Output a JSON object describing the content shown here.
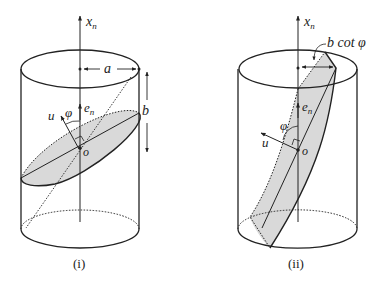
{
  "figure": {
    "panels": [
      {
        "id": "i",
        "caption": "(i)",
        "labels": {
          "axis": "x",
          "axis_sub": "n",
          "radius": "a",
          "height": "b",
          "normal": "e",
          "normal_sub": "n",
          "angle": "φ",
          "direction": "u",
          "origin": "o"
        },
        "description": "Cylinder with tilted elliptical cross-section (shaded) through origin o"
      },
      {
        "id": "ii",
        "caption": "(ii)",
        "labels": {
          "axis": "x",
          "axis_sub": "n",
          "offset": "b cot φ",
          "normal": "e",
          "normal_sub": "n",
          "angle": "φ",
          "direction": "u",
          "origin": "o"
        },
        "description": "Cylinder with steeply tilted cross-section (shaded) cut by top and bottom faces"
      }
    ],
    "colors": {
      "stroke": "#222222",
      "shade": "#d9d9d9",
      "background": "#ffffff"
    }
  }
}
